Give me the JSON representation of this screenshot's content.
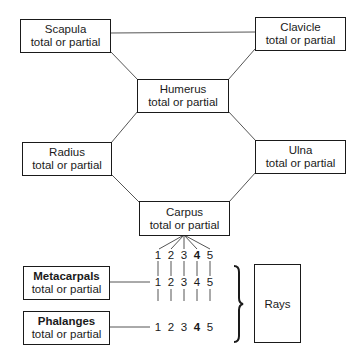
{
  "diagram": {
    "nodes": {
      "scapula": {
        "label": "Scapula",
        "sub": "total or partial"
      },
      "clavicle": {
        "label": "Clavicle",
        "sub": "total or partial"
      },
      "humerus": {
        "label": "Humerus",
        "sub": "total or partial"
      },
      "radius": {
        "label": "Radius",
        "sub": "total or partial"
      },
      "ulna": {
        "label": "Ulna",
        "sub": "total or partial"
      },
      "carpus": {
        "label": "Carpus",
        "sub": "total or partial"
      },
      "metacarpals": {
        "label": "Metacarpals",
        "sub": "total or partial"
      },
      "phalanges": {
        "label": "Phalanges",
        "sub": "total or partial"
      },
      "rays": {
        "label": "Rays"
      }
    },
    "ray_numbers": {
      "carpus_row": [
        "1",
        "2",
        "3",
        "4",
        "5"
      ],
      "metacarpal_row": [
        "1",
        "2",
        "3",
        "4",
        "5"
      ],
      "phalanges_row": [
        "1",
        "2",
        "3",
        "4",
        "5"
      ]
    },
    "edges": [
      [
        "scapula",
        "clavicle"
      ],
      [
        "scapula",
        "humerus"
      ],
      [
        "clavicle",
        "humerus"
      ],
      [
        "humerus",
        "radius"
      ],
      [
        "humerus",
        "ulna"
      ],
      [
        "radius",
        "carpus"
      ],
      [
        "ulna",
        "carpus"
      ],
      [
        "carpus",
        "ray_1..5"
      ],
      [
        "metacarpals",
        "ray_row"
      ],
      [
        "phalanges",
        "ray_row"
      ]
    ],
    "colors": {
      "line": "#1a1a1a",
      "background": "#ffffff"
    }
  }
}
